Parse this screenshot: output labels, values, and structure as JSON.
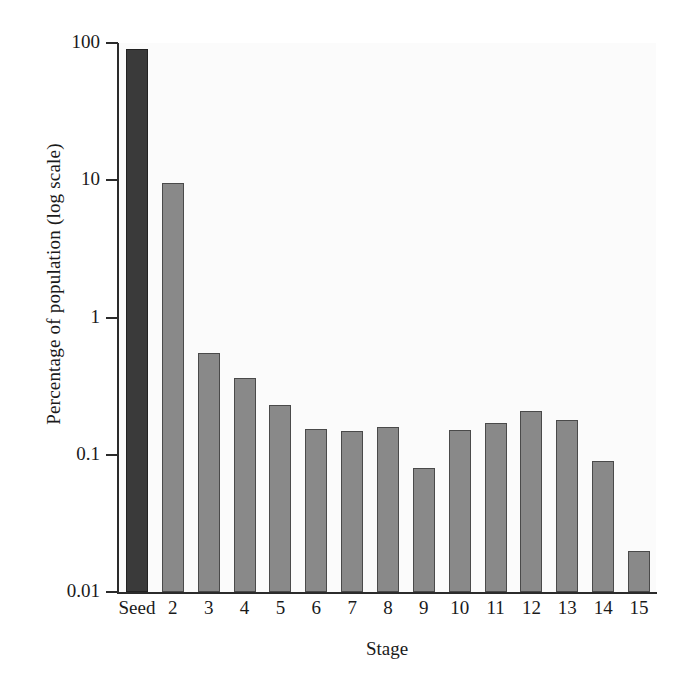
{
  "chart_data": {
    "type": "bar",
    "title": "",
    "xlabel": "Stage",
    "ylabel": "Percentage of population (log scale)",
    "yscale": "log",
    "ylim": [
      0.01,
      100
    ],
    "ytick_labels": [
      "100",
      "10",
      "1",
      "0.1",
      "0.01"
    ],
    "ytick_values": [
      100,
      10,
      1,
      0.1,
      0.01
    ],
    "grid": false,
    "legend": null,
    "categories": [
      "Seed",
      "2",
      "3",
      "4",
      "5",
      "6",
      "7",
      "8",
      "9",
      "10",
      "11",
      "12",
      "13",
      "14",
      "15"
    ],
    "values": [
      90,
      9.5,
      0.55,
      0.36,
      0.23,
      0.155,
      0.15,
      0.16,
      0.08,
      0.152,
      0.17,
      0.21,
      0.18,
      0.09,
      0.02
    ],
    "series": [
      {
        "name": "Percentage of population",
        "values": [
          90,
          9.5,
          0.55,
          0.36,
          0.23,
          0.155,
          0.15,
          0.16,
          0.08,
          0.152,
          0.17,
          0.21,
          0.18,
          0.09,
          0.02
        ]
      }
    ],
    "bar_styles": [
      "seed",
      "normal",
      "normal",
      "normal",
      "normal",
      "normal",
      "normal",
      "normal",
      "normal",
      "normal",
      "normal",
      "normal",
      "normal",
      "normal",
      "normal"
    ],
    "colors": {
      "seed_bar": "#3a3a3a",
      "bar": "#898989",
      "bar_edge": "#4a4a4a",
      "axis": "#2b2b2b",
      "plot_background": "#fbfbfb",
      "figure_background": "#ffffff",
      "text": "#1a1a1a"
    }
  }
}
